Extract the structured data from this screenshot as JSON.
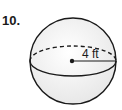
{
  "problem": {
    "number": "10.",
    "shape": "sphere",
    "radius_label": "4 ft"
  },
  "colors": {
    "stroke": "#1a1a1a",
    "fill": "#f4f4f4"
  }
}
